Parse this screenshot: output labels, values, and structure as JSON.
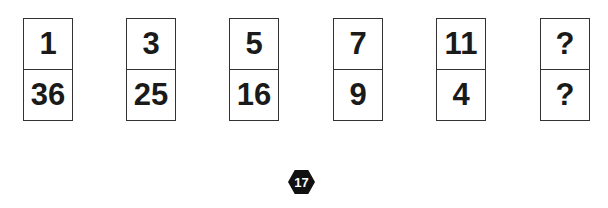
{
  "puzzle": {
    "dominoes": [
      {
        "top": "1",
        "bottom": "36"
      },
      {
        "top": "3",
        "bottom": "25"
      },
      {
        "top": "5",
        "bottom": "16"
      },
      {
        "top": "7",
        "bottom": "9"
      },
      {
        "top": "11",
        "bottom": "4"
      },
      {
        "top": "?",
        "bottom": "?"
      }
    ],
    "badge_number": "17"
  }
}
